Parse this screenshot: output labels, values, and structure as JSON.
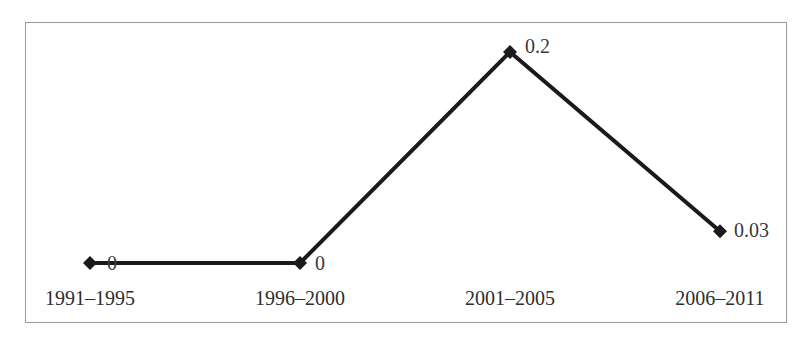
{
  "chart_data": {
    "type": "line",
    "title": "",
    "xlabel": "",
    "ylabel": "",
    "categories": [
      "1991–1995",
      "1996–2000",
      "2001–2005",
      "2006–2011"
    ],
    "series": [
      {
        "name": "",
        "values": [
          0,
          0,
          0.2,
          0.03
        ],
        "data_labels": [
          "0",
          "0",
          "0.2",
          "0.03"
        ],
        "marker": "diamond",
        "color": "#1a1a1a"
      }
    ],
    "ylim": [
      0,
      0.2
    ],
    "grid": false,
    "legend": null,
    "axes_visible": false,
    "frame_border_color": "#9a9a9a"
  }
}
